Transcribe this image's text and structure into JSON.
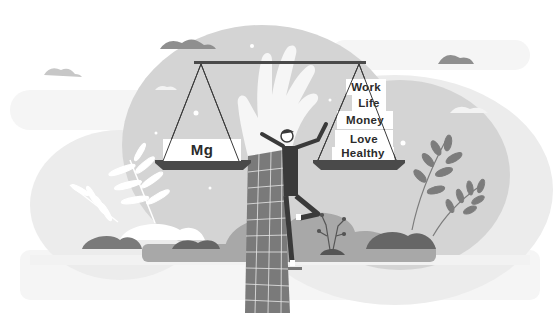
{
  "illustration": {
    "title": "Balance scale weighing Mg against life values",
    "left_pan": {
      "label": "Mg"
    },
    "right_pan": {
      "items": [
        {
          "label": "Work"
        },
        {
          "label": "Life"
        },
        {
          "label": "Money"
        },
        {
          "label": "Love"
        },
        {
          "label": "Healthy"
        }
      ]
    },
    "palette": {
      "background": "#ffffff",
      "backdrop_light": "#e6e6e6",
      "backdrop_mid": "#c9c9c9",
      "shape_mid": "#9a9a9a",
      "shape_dark": "#6e6e6e",
      "ink": "#3a3a3a",
      "hand": "#f4f4f4"
    }
  }
}
